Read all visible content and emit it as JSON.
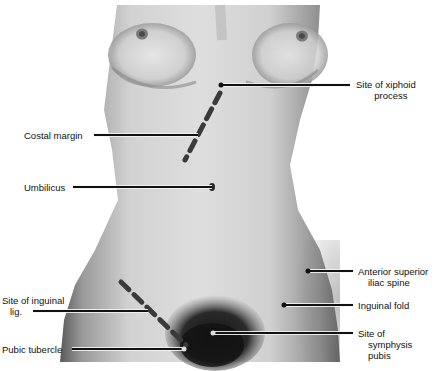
{
  "figure": {
    "labels": {
      "xiphoid": [
        "Site of xiphoid",
        "process"
      ],
      "costal_margin": "Costal margin",
      "umbilicus": "Umbilicus",
      "asis": [
        "Anterior superior",
        "iliac spine"
      ],
      "inguinal_fold": "Inguinal fold",
      "inguinal_lig": [
        "Site of inguinal",
        "lig."
      ],
      "symphysis": [
        "Site of",
        "symphysis",
        "pubis"
      ],
      "pubic_tubercle": "Pubic tubercle"
    },
    "colors": {
      "background": "#ffffff",
      "leader_line": "#111111",
      "dashed_marking": "#3a3a3a"
    }
  }
}
